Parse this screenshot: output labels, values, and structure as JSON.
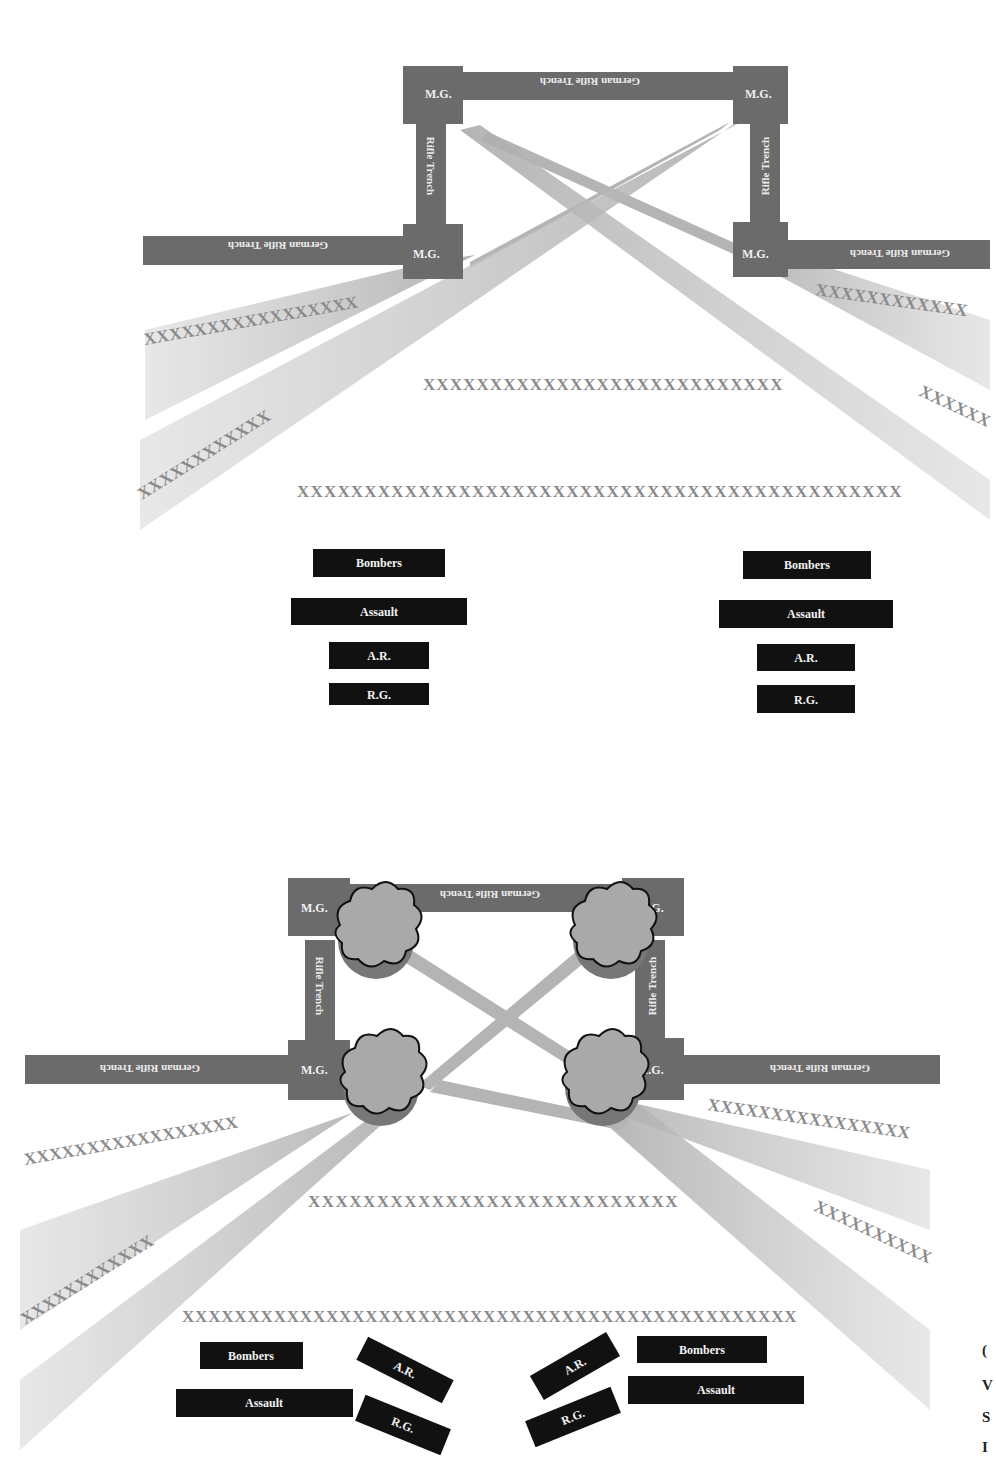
{
  "diagrams": [
    {
      "id": "before",
      "labels": {
        "trench_top": "German Rifle Trench",
        "trench_left": "German Rifle Trench",
        "trench_right": "German Rifle Trench",
        "rifle_left": "Rifle Trench",
        "rifle_right": "Rifle Trench",
        "mg_tl": "M.G.",
        "mg_tr": "M.G.",
        "mg_bl": "M.G.",
        "mg_br": "M.G."
      },
      "wire": {
        "left_upper": "XXXXXXXXXXXXXXXXX",
        "left_lower": "XXXXXXXXXXXX",
        "right_upper": "XXXXXXXXXXXX",
        "right_lower": "XXXXXX",
        "middle": "XXXXXXXXXXXXXXXXXXXXXXXXXXX",
        "front": "XXXXXXXXXXXXXXXXXXXXXXXXXXXXXXXXXXXXXXXXXXXXX"
      },
      "units_left": [
        "Bombers",
        "Assault",
        "A.R.",
        "R.G."
      ],
      "units_right": [
        "Bombers",
        "Assault",
        "A.R.",
        "R.G."
      ]
    },
    {
      "id": "after",
      "labels": {
        "trench_top": "German Rifle Trench",
        "trench_left": "German Rifle Trench",
        "trench_right": "German Rifle Trench",
        "rifle_left": "Rifle Trench",
        "rifle_right": "Rifle Trench",
        "mg_tl": "M.G.",
        "mg_tr": "M.G.",
        "mg_bl": "M.G.",
        "mg_br": "M.G."
      },
      "wire": {
        "left_upper": "XXXXXXXXXXXXXXXXX",
        "left_lower": "XXXXXXXXXXXX",
        "right_upper": "XXXXXXXXXXXXXXXX",
        "right_lower": "XXXXXXXXXX",
        "middle": "XXXXXXXXXXXXXXXXXXXXXXXXXXX",
        "front": "XXXXXXXXXXXXXXXXXXXXXXXXXXXXXXXXXXXXXXXXXXXXXXX"
      },
      "units_left": [
        "Bombers",
        "Assault",
        "A.R.",
        "R.G."
      ],
      "units_right": [
        "A.R.",
        "R.G.",
        "Bombers",
        "Assault"
      ]
    }
  ],
  "colors": {
    "trench": "#6b6b6b",
    "beam": "#b4b4b4",
    "wire": "#8a8a8a",
    "unit_box": "#111111",
    "smoke": "#a9a9a9"
  },
  "edge_fragments": [
    "(",
    "V",
    "S",
    "I"
  ]
}
